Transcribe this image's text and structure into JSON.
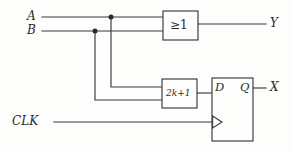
{
  "diagram": {
    "background_color": "#fdfdfc",
    "line_color": "#3a3a3a",
    "text_color": "#2b2b2b"
  },
  "inputs": [
    {
      "id": "A",
      "label": "A"
    },
    {
      "id": "B",
      "label": "B"
    },
    {
      "id": "CLK",
      "label": "CLK"
    }
  ],
  "outputs": [
    {
      "id": "Y",
      "label": "Y"
    },
    {
      "id": "X",
      "label": "X"
    }
  ],
  "blocks": [
    {
      "id": "or-gate",
      "label": "≥1",
      "name": "or-gate"
    },
    {
      "id": "parity",
      "label": "2k+1",
      "name": "parity-block"
    },
    {
      "id": "flipflop",
      "name": "d-flip-flop"
    }
  ],
  "flipflop_ports": {
    "data_label": "D",
    "output_label": "Q",
    "clock_label": ""
  },
  "junctions": [
    {
      "id": "junction-a",
      "on": "A"
    },
    {
      "id": "junction-b",
      "on": "B"
    }
  ]
}
